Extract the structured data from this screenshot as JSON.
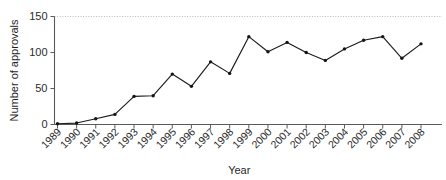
{
  "chart_data": {
    "type": "line",
    "title": "",
    "xlabel": "Year",
    "ylabel": "Number of approvals",
    "xlim": [
      1989,
      2008
    ],
    "ylim": [
      0,
      150
    ],
    "yticks": [
      0,
      50,
      100,
      150
    ],
    "ytick_labels": [
      "0",
      "50",
      "100",
      "150"
    ],
    "grid": "dotted gridline at y=150 only",
    "legend": "none",
    "marker": "filled circle",
    "line_color": "#1c1c1c",
    "marker_color": "#151515",
    "axis_color": "#5a5a5a",
    "gridline_color": "#b9b9b9",
    "background_color": "#ffffff",
    "categories": [
      "1989",
      "1990",
      "1991",
      "1992",
      "1993",
      "1994",
      "1995",
      "1996",
      "1997",
      "1998",
      "1999",
      "2000",
      "2001",
      "2002",
      "2003",
      "2004",
      "2005",
      "2006",
      "2007",
      "2008"
    ],
    "x": [
      1989,
      1990,
      1991,
      1992,
      1993,
      1994,
      1995,
      1996,
      1997,
      1998,
      1999,
      2000,
      2001,
      2002,
      2003,
      2004,
      2005,
      2006,
      2007,
      2008
    ],
    "values": [
      1,
      2,
      8,
      14,
      39,
      40,
      70,
      53,
      87,
      71,
      122,
      101,
      114,
      100,
      89,
      105,
      117,
      122,
      92,
      112
    ],
    "series": [
      {
        "name": "Number of approvals",
        "values": [
          1,
          2,
          8,
          14,
          39,
          40,
          70,
          53,
          87,
          71,
          122,
          101,
          114,
          100,
          89,
          105,
          117,
          122,
          92,
          112
        ]
      }
    ]
  }
}
